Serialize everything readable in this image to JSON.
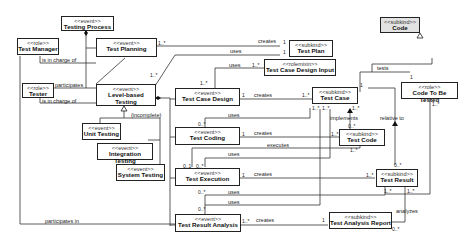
{
  "classes": {
    "testing_process": {
      "stereotype": "<<event>>",
      "name": "Testing Process"
    },
    "test_manager": {
      "stereotype": "<<role>>",
      "name": "Test Manager"
    },
    "test_planning": {
      "stereotype": "<<event>>",
      "name": "Test Planning"
    },
    "tester": {
      "stereotype": "<<role>>",
      "name": "Tester"
    },
    "level_based_testing": {
      "stereotype": "<<event>>",
      "name": "Level-based Testing"
    },
    "unit_testing": {
      "stereotype": "<<event>>",
      "name": "Unit Testing"
    },
    "integration_testing": {
      "stereotype": "<<event>>",
      "name": "Integration Testing"
    },
    "system_testing": {
      "stereotype": "<<event>>",
      "name": "System Testing"
    },
    "test_plan": {
      "stereotype": "<<subkind>>",
      "name": "Test Plan"
    },
    "test_case_design_input": {
      "stereotype": "<<rolemixin>>",
      "name": "Test Case Design Input"
    },
    "test_case_design": {
      "stereotype": "<<event>>",
      "name": "Test Case Design"
    },
    "test_case": {
      "stereotype": "<<subkind>>",
      "name": "Test Case"
    },
    "test_coding": {
      "stereotype": "<<event>>",
      "name": "Test Coding"
    },
    "test_code": {
      "stereotype": "<<subkind>>",
      "name": "Test Code"
    },
    "code": {
      "stereotype": "<<subkind>>",
      "name": "Code"
    },
    "code_to_be_tested": {
      "stereotype": "<<role>>",
      "name": "Code To Be Tested"
    },
    "test_execution": {
      "stereotype": "<<event>>",
      "name": "Test Execution"
    },
    "test_result": {
      "stereotype": "<<subkind>>",
      "name": "Test Result"
    },
    "test_result_analysis": {
      "stereotype": "<<event>>",
      "name": "Test Result Analysis"
    },
    "test_analysis_report": {
      "stereotype": "<<subkind>>",
      "name": "Test Analysis Report"
    }
  },
  "labels": {
    "is_in_charge_of_1": "is in charge of",
    "participates_1": "participates",
    "is_in_charge_of_2": "is in charge of",
    "incomplete": "{incomplete}",
    "creates_plan": "creates",
    "uses_plan": "uses",
    "uses_input": "uses",
    "creates_case": "creates",
    "uses_case": "uses",
    "creates_code": "creates",
    "implements": "implements",
    "relative_to": "relative to",
    "tests": "tests",
    "executes": "executes",
    "uses_exec": "uses",
    "creates_result": "creates",
    "uses_tra1": "uses",
    "uses_tra2": "uses",
    "creates_report": "creates",
    "analyzes": "analyzes",
    "participates_in": "participates in"
  },
  "multiplicities": {
    "m1": "1..*",
    "m2": "1",
    "m3": "1",
    "m4": "1..*",
    "m5": "1..*",
    "m6": "1",
    "m7": "1..*",
    "m8": "1",
    "m9": "1..*",
    "m10": "1",
    "m11": "1..*",
    "m12": "1..*",
    "m13": "0..*",
    "m14": "1",
    "m15": "1",
    "m16": "1..*",
    "m17": "0..*",
    "m18": "1..*",
    "m19": "1..*",
    "m20": "0..1",
    "m21": "0..*",
    "m22": "1",
    "m23": "1..*",
    "m24": "0..*",
    "m25": "0..*",
    "m26": "0..*",
    "m27": "1..*",
    "m28": "1",
    "m29": "1..*",
    "m30": "1..*",
    "m31": "0..*",
    "m32": "1..*"
  }
}
